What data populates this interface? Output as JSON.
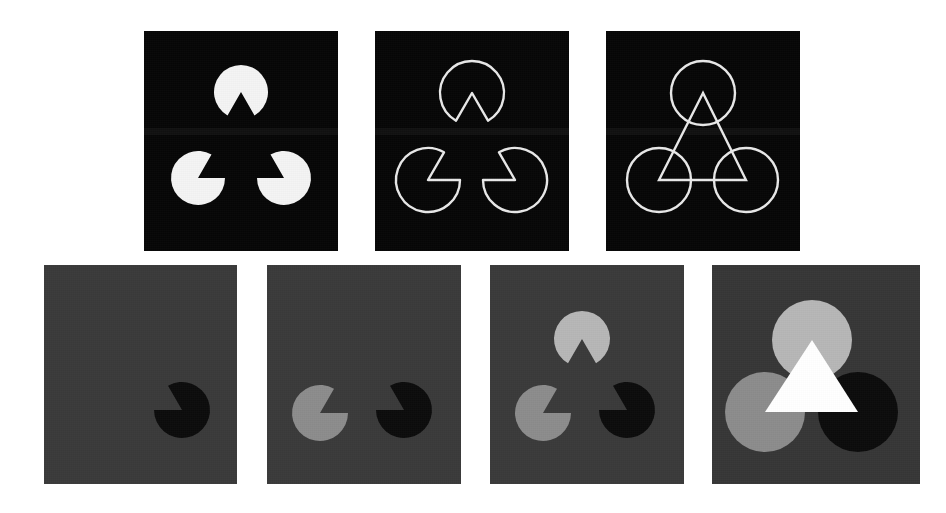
{
  "figure": {
    "caption": "",
    "background": "#ffffff",
    "width": 946,
    "height": 513
  },
  "palette": {
    "black_panel_bg": "#070707",
    "gray_panel_bg": "#3a3a3a",
    "gray_panel_bg_alt": "#363636",
    "white": "#f3f3f3",
    "pure_white": "#ffffff",
    "light_gray": "#b6b6b6",
    "mid_gray": "#8c8c8c",
    "dark_inducer": "#0c0c0c",
    "outline_stroke": "#e8e8e8"
  },
  "panels": [
    {
      "id": "panel-1",
      "name": "white-pacmen-on-black",
      "row": 1,
      "index": 1,
      "x": 144,
      "y": 31,
      "w": 194,
      "h": 220,
      "bg": "#070707",
      "style": "filled",
      "inducer_fill": "#f3f3f3",
      "inducer_stroke": "none",
      "triangle": "none",
      "circle_radius": 27,
      "inducers": [
        {
          "name": "top-inducer",
          "cx": 241,
          "cy": 92,
          "notch_deg": 90,
          "fill": "#f3f3f3"
        },
        {
          "name": "bottom-left-inducer",
          "cx": 198,
          "cy": 178,
          "notch_deg": 330,
          "fill": "#f3f3f3"
        },
        {
          "name": "bottom-right-inducer",
          "cx": 284,
          "cy": 178,
          "notch_deg": 210,
          "fill": "#f3f3f3"
        }
      ]
    },
    {
      "id": "panel-2",
      "name": "outlined-pacmen-on-black",
      "row": 1,
      "index": 2,
      "x": 375,
      "y": 31,
      "w": 194,
      "h": 220,
      "bg": "#070707",
      "style": "outline",
      "inducer_fill": "none",
      "inducer_stroke": "#e8e8e8",
      "triangle": "none",
      "circle_radius": 32,
      "inducers": [
        {
          "name": "top-inducer",
          "cx": 472,
          "cy": 93,
          "notch_deg": 90,
          "fill": "none"
        },
        {
          "name": "bottom-left-inducer",
          "cx": 428,
          "cy": 180,
          "notch_deg": 330,
          "fill": "none"
        },
        {
          "name": "bottom-right-inducer",
          "cx": 515,
          "cy": 180,
          "notch_deg": 210,
          "fill": "none"
        }
      ]
    },
    {
      "id": "panel-3",
      "name": "outlined-circles-with-outlined-triangle",
      "row": 1,
      "index": 3,
      "x": 606,
      "y": 31,
      "w": 194,
      "h": 220,
      "bg": "#070707",
      "style": "outline-full-circle",
      "inducer_fill": "none",
      "inducer_stroke": "#e8e8e8",
      "triangle": "outline",
      "triangle_stroke": "#e8e8e8",
      "circle_radius": 32,
      "inducers": [
        {
          "name": "top-inducer",
          "cx": 703,
          "cy": 93,
          "notch_deg": 90,
          "fill": "none"
        },
        {
          "name": "bottom-left-inducer",
          "cx": 659,
          "cy": 180,
          "notch_deg": 330,
          "fill": "none"
        },
        {
          "name": "bottom-right-inducer",
          "cx": 746,
          "cy": 180,
          "notch_deg": 210,
          "fill": "none"
        }
      ]
    },
    {
      "id": "panel-4",
      "name": "one-black-pacman-on-gray",
      "row": 2,
      "index": 4,
      "x": 44,
      "y": 265,
      "w": 193,
      "h": 219,
      "bg": "#3a3a3a",
      "style": "filled",
      "triangle": "none",
      "circle_radius": 28,
      "inducers": [
        {
          "name": "bottom-right-inducer",
          "cx": 182,
          "cy": 410,
          "notch_deg": 210,
          "fill": "#0c0c0c"
        }
      ]
    },
    {
      "id": "panel-5",
      "name": "two-pacmen-on-gray",
      "row": 2,
      "index": 5,
      "x": 267,
      "y": 265,
      "w": 194,
      "h": 219,
      "bg": "#3a3a3a",
      "style": "filled",
      "triangle": "none",
      "circle_radius": 28,
      "inducers": [
        {
          "name": "bottom-left-inducer",
          "cx": 320,
          "cy": 413,
          "notch_deg": 330,
          "fill": "#8c8c8c"
        },
        {
          "name": "bottom-right-inducer",
          "cx": 404,
          "cy": 410,
          "notch_deg": 210,
          "fill": "#0c0c0c"
        }
      ]
    },
    {
      "id": "panel-6",
      "name": "three-pacmen-on-gray",
      "row": 2,
      "index": 6,
      "x": 490,
      "y": 265,
      "w": 194,
      "h": 219,
      "bg": "#3a3a3a",
      "style": "filled",
      "triangle": "none",
      "circle_radius": 28,
      "inducers": [
        {
          "name": "top-inducer",
          "cx": 582,
          "cy": 339,
          "notch_deg": 90,
          "fill": "#b6b6b6"
        },
        {
          "name": "bottom-left-inducer",
          "cx": 543,
          "cy": 413,
          "notch_deg": 330,
          "fill": "#8c8c8c"
        },
        {
          "name": "bottom-right-inducer",
          "cx": 627,
          "cy": 410,
          "notch_deg": 210,
          "fill": "#0c0c0c"
        }
      ]
    },
    {
      "id": "panel-7",
      "name": "three-circles-with-opaque-white-triangle",
      "row": 2,
      "index": 7,
      "x": 712,
      "y": 265,
      "w": 208,
      "h": 219,
      "bg": "#363636",
      "style": "full-circle",
      "triangle": "filled",
      "triangle_fill": "#ffffff",
      "circle_radius": 40,
      "inducers": [
        {
          "name": "top-inducer",
          "cx": 812,
          "cy": 340,
          "notch_deg": 90,
          "fill": "#b6b6b6"
        },
        {
          "name": "bottom-left-inducer",
          "cx": 765,
          "cy": 412,
          "notch_deg": 330,
          "fill": "#8c8c8c"
        },
        {
          "name": "bottom-right-inducer",
          "cx": 858,
          "cy": 412,
          "notch_deg": 210,
          "fill": "#0c0c0c"
        }
      ]
    }
  ]
}
